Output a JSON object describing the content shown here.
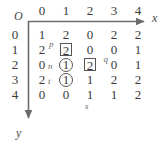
{
  "diagram": {
    "type": "matrix-grid-with-axes",
    "origin_label": "O",
    "x_axis_label": "x",
    "y_axis_label": "y",
    "column_ticks": [
      "0",
      "1",
      "2",
      "3",
      "4"
    ],
    "row_ticks": [
      "0",
      "1",
      "2",
      "3",
      "4"
    ],
    "grid": [
      [
        {
          "value": "1",
          "mark": "none",
          "ann": null,
          "ann_pos": null
        },
        {
          "value": "2",
          "mark": "none",
          "ann": null,
          "ann_pos": null
        },
        {
          "value": "0",
          "mark": "none",
          "ann": null,
          "ann_pos": null
        },
        {
          "value": "2",
          "mark": "none",
          "ann": null,
          "ann_pos": null
        },
        {
          "value": "2",
          "mark": "none",
          "ann": null,
          "ann_pos": null
        }
      ],
      [
        {
          "value": "2",
          "mark": "none",
          "ann": null,
          "ann_pos": null
        },
        {
          "value": "2",
          "mark": "boxed",
          "ann": "p",
          "ann_pos": "sup-left"
        },
        {
          "value": "0",
          "mark": "none",
          "ann": null,
          "ann_pos": null
        },
        {
          "value": "0",
          "mark": "none",
          "ann": null,
          "ann_pos": null
        },
        {
          "value": "1",
          "mark": "none",
          "ann": null,
          "ann_pos": null
        }
      ],
      [
        {
          "value": "0",
          "mark": "none",
          "ann": null,
          "ann_pos": null
        },
        {
          "value": "1",
          "mark": "circled",
          "ann": "n",
          "ann_pos": "pre-left"
        },
        {
          "value": "2",
          "mark": "boxed",
          "ann": "q",
          "ann_pos": "sup-right"
        },
        {
          "value": "0",
          "mark": "none",
          "ann": null,
          "ann_pos": null
        },
        {
          "value": "1",
          "mark": "none",
          "ann": null,
          "ann_pos": null
        }
      ],
      [
        {
          "value": "2",
          "mark": "none",
          "ann": null,
          "ann_pos": null
        },
        {
          "value": "1",
          "mark": "circled",
          "ann": "t",
          "ann_pos": "pre-left"
        },
        {
          "value": "1",
          "mark": "none",
          "ann": null,
          "ann_pos": null
        },
        {
          "value": "2",
          "mark": "none",
          "ann": null,
          "ann_pos": null
        },
        {
          "value": "2",
          "mark": "none",
          "ann": null,
          "ann_pos": null
        }
      ],
      [
        {
          "value": "0",
          "mark": "none",
          "ann": null,
          "ann_pos": null
        },
        {
          "value": "0",
          "mark": "none",
          "ann": null,
          "ann_pos": null
        },
        {
          "value": "1",
          "mark": "none",
          "ann": "s",
          "ann_pos": "below"
        },
        {
          "value": "1",
          "mark": "none",
          "ann": null,
          "ann_pos": null
        },
        {
          "value": "2",
          "mark": "none",
          "ann": null,
          "ann_pos": null
        }
      ]
    ],
    "colors": {
      "axis": "#6b6b6b",
      "text": "#3a3a3a",
      "annotation": "#6a6a6a",
      "mark_border": "#555555",
      "background": "#ffffff"
    }
  }
}
